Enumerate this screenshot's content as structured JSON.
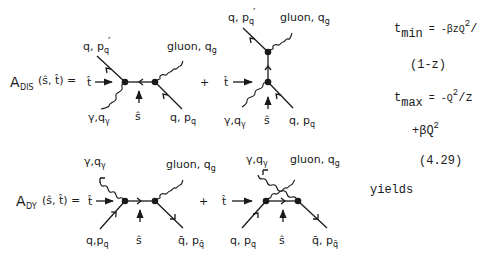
{
  "diagrams": {
    "dis": {
      "lhs_A": "A",
      "lhs_sub": "DIS",
      "lhs_args": "(ŝ, t̂) =",
      "t_label": "t̂",
      "s_label": "ŝ",
      "plus": "+",
      "out_quark": {
        "main": "q, p",
        "sub": "q",
        "prime": "′"
      },
      "gluon": {
        "main": "gluon, q",
        "sub": "g"
      },
      "photon": {
        "main": "γ,q",
        "sub": "γ"
      },
      "in_quark": {
        "main": "q, p",
        "sub": "q"
      }
    },
    "dy": {
      "lhs_A": "A",
      "lhs_sub": "DY",
      "lhs_args": "(ŝ, t̂) =",
      "t_label": "t̂",
      "s_label": "ŝ",
      "plus": "+",
      "photon": {
        "main": "γ,q",
        "sub": "γ"
      },
      "gluon": {
        "main": "gluon, q",
        "sub": "g"
      },
      "in_quark": {
        "main": "q,p",
        "sub": "q"
      },
      "in_quark2": {
        "main": "q, p",
        "sub": "q"
      },
      "out_antiquark": {
        "main": "q̄, p",
        "sub": "q̄"
      }
    }
  },
  "equations": {
    "tmin": {
      "t": "t",
      "sub": "min",
      "rhs": "= -βzQ",
      "sup": "2",
      "tail": "/"
    },
    "tmin_cont": "(1-z)",
    "tmax": {
      "t": "t",
      "sub": "max",
      "rhs": "= -Q",
      "sup": "2",
      "tail": "/z"
    },
    "tmax_cont": {
      "main": "+βQ",
      "sup": "2"
    },
    "eq_number": "(4.29)",
    "yields": "yields"
  }
}
